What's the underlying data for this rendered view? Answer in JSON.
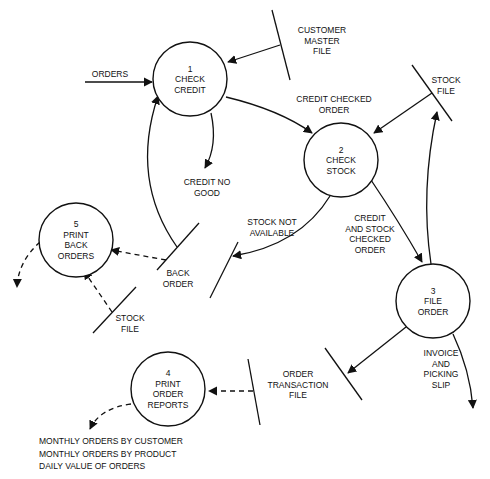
{
  "diagram": {
    "type": "data-flow-diagram",
    "processes": [
      {
        "id": "1",
        "number": "1",
        "lines": [
          "CHECK",
          "CREDIT"
        ]
      },
      {
        "id": "2",
        "number": "2",
        "lines": [
          "CHECK",
          "STOCK"
        ]
      },
      {
        "id": "3",
        "number": "3",
        "lines": [
          "FILE",
          "ORDER"
        ]
      },
      {
        "id": "4",
        "number": "4",
        "lines": [
          "PRINT",
          "ORDER",
          "REPORTS"
        ]
      },
      {
        "id": "5",
        "number": "5",
        "lines": [
          "PRINT",
          "BACK",
          "ORDERS"
        ]
      }
    ],
    "stores": [
      {
        "id": "customer-master",
        "lines": [
          "CUSTOMER",
          "MASTER",
          "FILE"
        ]
      },
      {
        "id": "stock-file-top",
        "lines": [
          "STOCK",
          "FILE"
        ]
      },
      {
        "id": "back-order",
        "lines": [
          "BACK",
          "ORDER"
        ]
      },
      {
        "id": "stock-file-bottom",
        "lines": [
          "STOCK",
          "FILE"
        ]
      },
      {
        "id": "order-transaction",
        "lines": [
          "ORDER",
          "TRANSACTION",
          "FILE"
        ]
      },
      {
        "id": "stock-unavailable",
        "lines": []
      }
    ],
    "flows": [
      {
        "id": "orders",
        "lines": [
          "ORDERS"
        ],
        "style": "solid"
      },
      {
        "id": "customer-to-credit",
        "lines": [],
        "style": "solid"
      },
      {
        "id": "credit-checked",
        "lines": [
          "CREDIT CHECKED",
          "ORDER"
        ],
        "style": "solid"
      },
      {
        "id": "credit-no-good",
        "lines": [
          "CREDIT NO",
          "GOOD"
        ],
        "style": "solid"
      },
      {
        "id": "stockfile-to-2",
        "lines": [],
        "style": "solid"
      },
      {
        "id": "stock-not-available",
        "lines": [
          "STOCK NOT",
          "AVAILABLE"
        ],
        "style": "solid"
      },
      {
        "id": "credit-stock-checked",
        "lines": [
          "CREDIT",
          "AND STOCK",
          "CHECKED",
          "ORDER"
        ],
        "style": "solid"
      },
      {
        "id": "3-to-stockfile",
        "lines": [],
        "style": "solid"
      },
      {
        "id": "backorder-to-1",
        "lines": [],
        "style": "solid"
      },
      {
        "id": "backorder-to-5",
        "lines": [],
        "style": "dashed"
      },
      {
        "id": "stockfile-to-5",
        "lines": [],
        "style": "dashed"
      },
      {
        "id": "5-output",
        "lines": [],
        "style": "dashed"
      },
      {
        "id": "3-to-transaction",
        "lines": [],
        "style": "solid"
      },
      {
        "id": "invoice",
        "lines": [
          "INVOICE",
          "AND",
          "PICKING",
          "SLIP"
        ],
        "style": "solid"
      },
      {
        "id": "transaction-to-4",
        "lines": [],
        "style": "dashed"
      },
      {
        "id": "4-output",
        "lines": [],
        "style": "dashed"
      }
    ],
    "outputs": {
      "reports": [
        "MONTHLY ORDERS BY CUSTOMER",
        "MONTHLY ORDERS BY PRODUCT",
        "DAILY VALUE OF ORDERS"
      ]
    }
  }
}
